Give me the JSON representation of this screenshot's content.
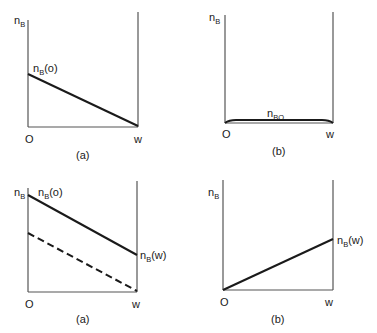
{
  "panels": [
    {
      "id": "top-a",
      "y_axis_label": "n",
      "y_axis_sub": "B",
      "line_label": "n",
      "line_label_sub": "B",
      "line_label_suffix": "(o)",
      "origin_label": "O",
      "end_label": "w",
      "caption": "(a)"
    },
    {
      "id": "top-b",
      "y_axis_label": "n",
      "y_axis_sub": "B",
      "line_label": "n",
      "line_label_sub": "BO",
      "origin_label": "O",
      "end_label": "w",
      "caption": "(b)"
    },
    {
      "id": "bottom-a",
      "y_axis_label": "n",
      "y_axis_sub": "B",
      "line_label": "n",
      "line_label_sub": "B",
      "line_label_suffix": "(o)",
      "end_value_label": "n",
      "end_value_sub": "B",
      "end_value_suffix": "(w)",
      "origin_label": "O",
      "end_label": "w",
      "caption": "(a)"
    },
    {
      "id": "bottom-b",
      "y_axis_label": "n",
      "y_axis_sub": "B",
      "end_value_label": "n",
      "end_value_sub": "B",
      "end_value_suffix": "(w)",
      "origin_label": "O",
      "end_label": "w",
      "caption": "(b)"
    }
  ],
  "colors": {
    "line": "#1a1a1a",
    "axis": "#4a4a4a"
  }
}
